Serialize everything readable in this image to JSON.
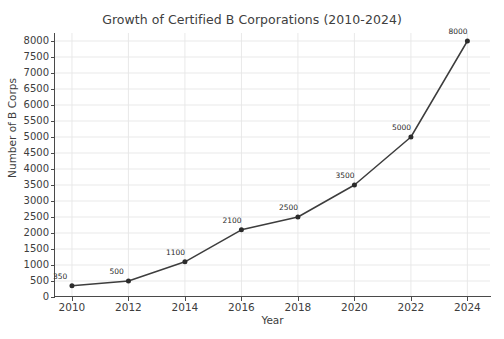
{
  "chart_data": {
    "type": "line",
    "title": "Growth of Certified B Corporations (2010-2024)",
    "xlabel": "Year",
    "ylabel": "Number of B Corps",
    "x": [
      2010,
      2012,
      2014,
      2016,
      2018,
      2020,
      2022,
      2024
    ],
    "values": [
      350,
      500,
      1100,
      2100,
      2500,
      3500,
      5000,
      8000
    ],
    "point_labels": [
      "350",
      "500",
      "1100",
      "2100",
      "2500",
      "3500",
      "5000",
      "8000"
    ],
    "xtick_labels": [
      "2010",
      "2012",
      "2014",
      "2016",
      "2018",
      "2020",
      "2022",
      "2024"
    ],
    "ytick_labels": [
      "0",
      "500",
      "1000",
      "1500",
      "2000",
      "2500",
      "3000",
      "3500",
      "4000",
      "4500",
      "5000",
      "5500",
      "6000",
      "6500",
      "7000",
      "7500",
      "8000"
    ],
    "ytick_values": [
      0,
      500,
      1000,
      1500,
      2000,
      2500,
      3000,
      3500,
      4000,
      4500,
      5000,
      5500,
      6000,
      6500,
      7000,
      7500,
      8000
    ],
    "xlim": [
      2009.4,
      2024.8
    ],
    "ylim": [
      0,
      8250
    ],
    "grid": true,
    "legend": "none",
    "marker": "circle",
    "line_color": "#3d3d3d",
    "marker_color": "#2b2b2b",
    "grid_color": "#e6e6e6",
    "background_color": "#ffffff"
  }
}
